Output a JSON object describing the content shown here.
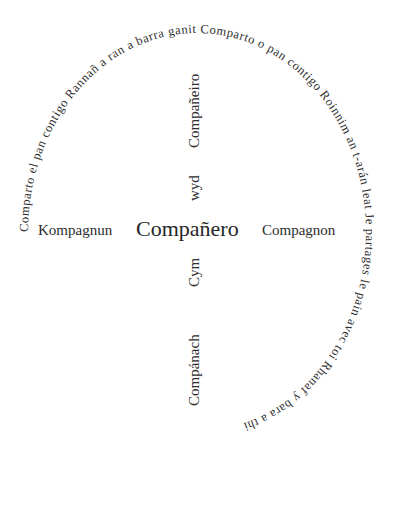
{
  "diagram": {
    "title_word": "Compañero",
    "ring": {
      "text": "Comparto el pan contigo Rannañ a ran a barra ganit Comparto o pan contigo Roinnim an t-arán leat Je partages le pain avec toi Rhanaf y bara a thi",
      "phrases": [
        "Comparto el pan contigo",
        "Rannañ a ran a barra ganit",
        "Comparto o pan contigo",
        "Roinnim an t-arán leat",
        "Je partages le pain avec toi",
        "Rhanaf y bara a thi"
      ],
      "direction": "clockwise",
      "start_position": "left"
    },
    "horizontal": {
      "left": "Kompagnun",
      "center": "Compañero",
      "right": "Compagnon"
    },
    "vertical": {
      "top_outer": "Compañeiro",
      "top_inner": "wyd",
      "bottom_inner": "Cym",
      "bottom_outer": "Compánach"
    },
    "colors": {
      "text": "#2e2e2e",
      "background": "#ffffff"
    }
  }
}
